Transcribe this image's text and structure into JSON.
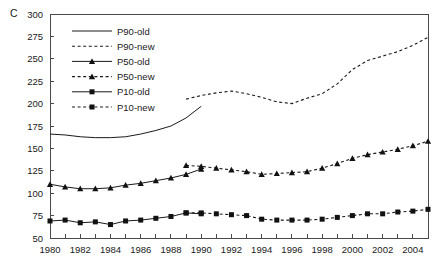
{
  "panel": {
    "label": "C"
  },
  "chart_data": {
    "type": "line",
    "title": "",
    "xlabel": "",
    "ylabel": "",
    "xlim": [
      1980,
      2005
    ],
    "ylim": [
      50,
      300
    ],
    "ytick_step": 25,
    "xtick_step": 1,
    "grid": false,
    "legend_position": "top-left inside plot",
    "yticks": [
      50,
      75,
      100,
      125,
      150,
      175,
      200,
      225,
      250,
      275,
      300
    ],
    "xticks": [
      1980,
      1981,
      1982,
      1983,
      1984,
      1985,
      1986,
      1987,
      1988,
      1989,
      1990,
      1991,
      1992,
      1993,
      1994,
      1995,
      1996,
      1997,
      1998,
      1999,
      2000,
      2001,
      2002,
      2003,
      2004,
      2005
    ],
    "xtick_labels": [
      "1980",
      "",
      "1982",
      "",
      "1984",
      "",
      "1986",
      "",
      "1988",
      "",
      "1990",
      "",
      "1992",
      "",
      "1994",
      "",
      "1996",
      "",
      "1998",
      "",
      "2000",
      "",
      "2002",
      "",
      "2004",
      ""
    ],
    "ytick_labels": [
      "50",
      "75",
      "100",
      "125",
      "150",
      "175",
      "200",
      "225",
      "250",
      "275",
      "300"
    ],
    "series": [
      {
        "name": "P90-old",
        "style": "solid",
        "marker": "none",
        "x": [
          1980,
          1981,
          1982,
          1983,
          1984,
          1985,
          1986,
          1987,
          1988,
          1989,
          1990
        ],
        "values": [
          166,
          165,
          163,
          162,
          162,
          163,
          166,
          170,
          175,
          184,
          197
        ]
      },
      {
        "name": "P90-new",
        "style": "dashed",
        "marker": "none",
        "x": [
          1989,
          1990,
          1991,
          1992,
          1993,
          1994,
          1995,
          1996,
          1997,
          1998,
          1999,
          2000,
          2001,
          2002,
          2003,
          2004,
          2005
        ],
        "values": [
          205,
          209,
          212,
          214,
          211,
          207,
          202,
          200,
          206,
          211,
          222,
          238,
          248,
          253,
          258,
          265,
          274
        ]
      },
      {
        "name": "P50-old",
        "style": "solid",
        "marker": "triangle",
        "x": [
          1980,
          1981,
          1982,
          1983,
          1984,
          1985,
          1986,
          1987,
          1988,
          1989,
          1990
        ],
        "values": [
          110,
          107,
          105,
          105,
          106,
          109,
          111,
          114,
          117,
          121,
          127
        ]
      },
      {
        "name": "P50-new",
        "style": "dashed",
        "marker": "triangle",
        "x": [
          1989,
          1990,
          1991,
          1992,
          1993,
          1994,
          1995,
          1996,
          1997,
          1998,
          1999,
          2000,
          2001,
          2002,
          2003,
          2004,
          2005
        ],
        "values": [
          131,
          130,
          128,
          126,
          124,
          121,
          122,
          123,
          124,
          128,
          133,
          139,
          143,
          146,
          149,
          153,
          158
        ]
      },
      {
        "name": "P10-old",
        "style": "solid",
        "marker": "square",
        "x": [
          1980,
          1981,
          1982,
          1983,
          1984,
          1985,
          1986,
          1987,
          1988,
          1989,
          1990
        ],
        "values": [
          69,
          70,
          67,
          68,
          65,
          69,
          70,
          72,
          74,
          78,
          77
        ]
      },
      {
        "name": "P10-new",
        "style": "dashed",
        "marker": "square",
        "x": [
          1989,
          1990,
          1991,
          1992,
          1993,
          1994,
          1995,
          1996,
          1997,
          1998,
          1999,
          2000,
          2001,
          2002,
          2003,
          2004,
          2005
        ],
        "values": [
          78,
          78,
          77,
          76,
          75,
          71,
          70,
          70,
          70,
          71,
          73,
          75,
          77,
          77,
          79,
          80,
          82
        ]
      }
    ],
    "legend": [
      {
        "label": "P90-old",
        "style": "solid",
        "marker": "none"
      },
      {
        "label": "P90-new",
        "style": "dashed",
        "marker": "none"
      },
      {
        "label": "P50-old",
        "style": "solid",
        "marker": "triangle"
      },
      {
        "label": "P50-new",
        "style": "dashed",
        "marker": "triangle"
      },
      {
        "label": "P10-old",
        "style": "solid",
        "marker": "square"
      },
      {
        "label": "P10-new",
        "style": "dashed",
        "marker": "square"
      }
    ]
  }
}
